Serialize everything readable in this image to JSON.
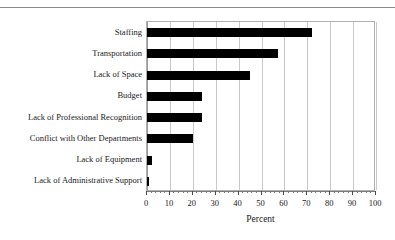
{
  "chart_data": {
    "type": "bar",
    "orientation": "horizontal",
    "title": "",
    "xlabel": "Percent",
    "ylabel": "",
    "xlim": [
      0,
      100
    ],
    "xticks": [
      0,
      10,
      20,
      30,
      40,
      50,
      60,
      70,
      80,
      90,
      100
    ],
    "xtick_labels": [
      "0",
      "10",
      "20",
      "30",
      "40",
      "50",
      "60",
      "70",
      "80",
      "90",
      "100"
    ],
    "minor_tick_interval": 2,
    "grid": "vertical",
    "legend": "none",
    "bar_color": "#000000",
    "grid_color": "#c9c9c9",
    "categories": [
      "Staffing",
      "Transportation",
      "Lack of Space",
      "Budget",
      "Lack of Professional Recognition",
      "Conflict with Other Departments",
      "Lack of Equipment",
      "Lack of Administrative Support"
    ],
    "values": [
      72,
      57,
      45,
      24,
      24,
      20,
      2,
      1
    ]
  }
}
